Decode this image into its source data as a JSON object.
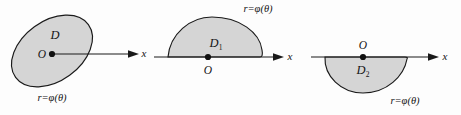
{
  "figure": {
    "name": "polar-regions-figure",
    "background_color": "#fdfdfd",
    "fill_color": "#d5d5d5",
    "stroke_color": "#1a1a1a",
    "panel_count": 3
  },
  "panels": [
    {
      "id": "panel-1",
      "shape": "tilted-ellipse-containing-origin",
      "region_label": "D",
      "origin_label": "O",
      "axis_label": "x",
      "curve_label_r": "r",
      "curve_label_eq": "=",
      "curve_label_phi": "φ",
      "curve_label_paren_open": "(",
      "curve_label_theta": "θ",
      "curve_label_paren_close": ")",
      "curve_label_full": "r=φ(θ)",
      "curve_label_position": "below-left"
    },
    {
      "id": "panel-2",
      "shape": "dome-above-axis",
      "region_label": "D",
      "region_subscript": "1",
      "region_label_full": "D₁",
      "origin_label": "O",
      "origin_position": "below-axis",
      "axis_label": "x",
      "curve_label_full": "r=φ(θ)",
      "curve_label_position": "above-right"
    },
    {
      "id": "panel-3",
      "shape": "dome-below-axis",
      "region_label": "D",
      "region_subscript": "2",
      "region_label_full": "D₂",
      "origin_label": "O",
      "origin_position": "above-axis",
      "axis_label": "x",
      "curve_label_full": "r=φ(θ)",
      "curve_label_position": "below-right"
    }
  ]
}
